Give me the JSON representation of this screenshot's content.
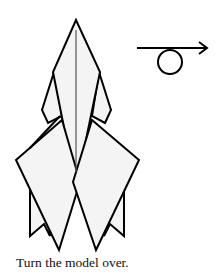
{
  "step": {
    "caption": "Turn the model over.",
    "symbol": "turn-over-arrow-icon"
  },
  "colors": {
    "paper_fill": "#f4f4f4",
    "line": "#000000",
    "background": "#ffffff"
  }
}
